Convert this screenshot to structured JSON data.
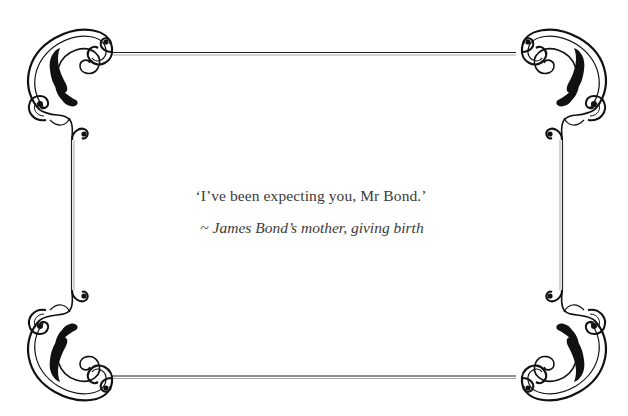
{
  "card": {
    "background": "#ffffff",
    "border_color": "#1a1a1a",
    "ornament_color": "#111111",
    "text_color": "#3a3a3a"
  },
  "quote": {
    "text": "‘I’ve been expecting you, Mr Bond.’",
    "attribution": "~ James Bond’s mother, giving birth"
  },
  "ornaments": {
    "corners": [
      "top-left-flourish-icon",
      "top-right-flourish-icon",
      "bottom-left-flourish-icon",
      "bottom-right-flourish-icon"
    ]
  }
}
